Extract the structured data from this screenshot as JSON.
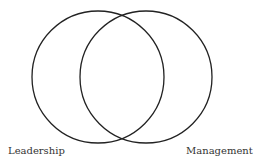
{
  "diagram": {
    "type": "venn",
    "sets": [
      {
        "label": "Leadership",
        "cx": 98,
        "cy": 77,
        "r": 66
      },
      {
        "label": "Management",
        "cx": 146,
        "cy": 77,
        "r": 66
      }
    ],
    "stroke_color": "#222222",
    "background": "#ffffff"
  }
}
